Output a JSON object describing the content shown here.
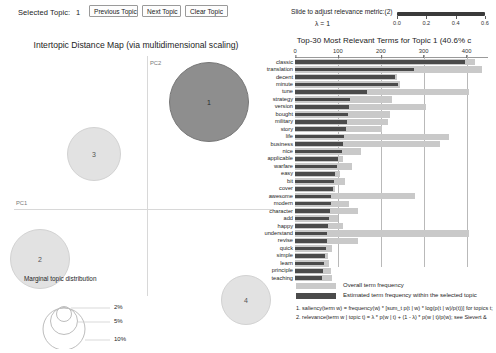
{
  "toolbar": {
    "selected_topic_label": "Selected Topic:",
    "selected_topic_value": "1",
    "previous_topic": "Previous Topic",
    "next_topic": "Next Topic",
    "clear_topic": "Clear Topic"
  },
  "slider": {
    "label": "Slide to adjust relevance metric:(2)",
    "lambda_text": "λ = 1",
    "value": 1,
    "ticks": [
      "0.0",
      "0.2",
      "0.4",
      "0.6"
    ],
    "tick_values": [
      0.0,
      0.2,
      0.4,
      0.6
    ]
  },
  "map": {
    "title": "Intertopic Distance Map (via multidimensional scaling)",
    "axis_x_label": "PC1",
    "axis_y_label": "PC2",
    "selected_topic": 1,
    "topics": [
      {
        "id": "1",
        "x": 208,
        "y": 73,
        "r": 39,
        "selected": true
      },
      {
        "id": "2",
        "x": 39,
        "y": 230,
        "r": 29,
        "selected": false
      },
      {
        "id": "3",
        "x": 93,
        "y": 125,
        "r": 26,
        "selected": false
      },
      {
        "id": "4",
        "x": 245,
        "y": 271,
        "r": 24,
        "selected": false
      }
    ],
    "marginal": {
      "title": "Marginal topic distribution",
      "levels": [
        "2%",
        "5%",
        "10%"
      ]
    }
  },
  "bar_panel": {
    "title": "Top-30 Most Relevant Terms for Topic 1 (40.6% c",
    "legend_overall": "Overall term frequency",
    "legend_topic": "Estimated term frequency within the selected topic",
    "formula_1": "1. saliency(term w) = frequency(w) * [sum_t p(t | w) * log(p(t | w)/p(t))] for topics t;",
    "formula_2": "2. relevance(term w | topic t) = λ * p(w | t) + (1 - λ) * p(w | t)/p(w); see Sievert &"
  },
  "chart_data": {
    "type": "bar",
    "title": "Top-30 Most Relevant Terms for Topic 1 (40.6% c",
    "xlabel": "",
    "ylabel": "",
    "xlim": [
      0,
      450
    ],
    "ticks": [
      0,
      100,
      200,
      300,
      400
    ],
    "grid": true,
    "legend_position": "bottom",
    "orientation": "horizontal",
    "categories": [
      "classic",
      "translation",
      "decent",
      "minute",
      "tune",
      "strategy",
      "version",
      "bought",
      "military",
      "story",
      "life",
      "business",
      "nice",
      "applicable",
      "warfare",
      "easy",
      "bit",
      "cover",
      "awesome",
      "modern",
      "character",
      "add",
      "happy",
      "understand",
      "revise",
      "quick",
      "simple",
      "learn",
      "principle",
      "teaching"
    ],
    "series": [
      {
        "name": "Overall term frequency",
        "values": [
          420,
          435,
          237,
          245,
          405,
          226,
          305,
          222,
          216,
          203,
          360,
          337,
          155,
          112,
          134,
          105,
          117,
          93,
          280,
          125,
          146,
          100,
          112,
          405,
          147,
          86,
          77,
          79,
          83,
          86
        ]
      },
      {
        "name": "Estimated term frequency within the selected topic",
        "values": [
          397,
          278,
          232,
          240,
          168,
          129,
          126,
          123,
          121,
          118,
          115,
          113,
          109,
          101,
          99,
          94,
          91,
          88,
          85,
          83,
          81,
          79,
          77,
          75,
          74,
          72,
          70,
          68,
          66,
          64
        ]
      }
    ]
  }
}
